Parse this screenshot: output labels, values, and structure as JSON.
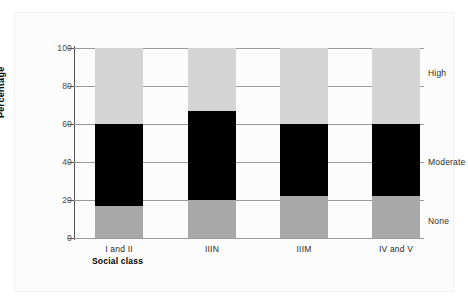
{
  "chart_data": {
    "type": "bar",
    "subtype": "stacked-bar",
    "title": "",
    "xlabel": "Social class",
    "ylabel": "Percentage",
    "ylim": [
      0,
      100
    ],
    "yticks": [
      0,
      20,
      40,
      60,
      80,
      100
    ],
    "grid": true,
    "legend_position": "right-inline",
    "categories": [
      "I and II",
      "IIIN",
      "IIIM",
      "IV and V"
    ],
    "series": [
      {
        "name": "None",
        "color": "#a8a8a8",
        "values": [
          17,
          20,
          22,
          22
        ]
      },
      {
        "name": "Moderate",
        "color": "#000000",
        "values": [
          43,
          47,
          38,
          38
        ]
      },
      {
        "name": "High",
        "color": "#d4d4d4",
        "values": [
          40,
          33,
          40,
          40
        ]
      }
    ],
    "cumulative_tops": {
      "none": [
        17,
        20,
        22,
        22
      ],
      "moderate": [
        60,
        67,
        60,
        60
      ],
      "high": [
        100,
        100,
        100,
        100
      ]
    },
    "segment_labels": [
      {
        "key": "high",
        "text": "High",
        "y_percent": 87
      },
      {
        "key": "moderate",
        "text": "Moderate",
        "y_percent": 40
      },
      {
        "key": "none",
        "text": "None",
        "y_percent": 9
      }
    ]
  },
  "axis": {
    "y_tick_labels": [
      "100",
      "80",
      "60",
      "40",
      "20",
      "0"
    ],
    "y_title": "Percentage",
    "x_title": "Social class"
  },
  "colors": {
    "none": "#a8a8a8",
    "moderate": "#000000",
    "high": "#d4d4d4",
    "grid": "#9a9a9a",
    "axis": "#555555",
    "background": "#fcfcfc"
  }
}
